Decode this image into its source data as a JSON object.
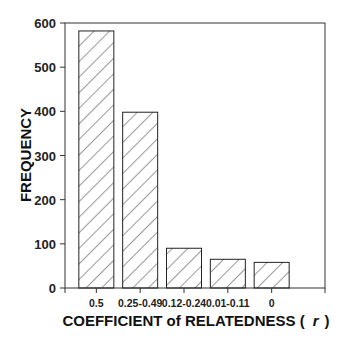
{
  "chart_data": {
    "type": "bar",
    "title": "",
    "xlabel": "COEFFICIENT of RELATEDNESS ( r )",
    "xlabel_main": "COEFFICIENT of RELATEDNESS (",
    "xlabel_symbol": "r",
    "xlabel_close": ")",
    "ylabel": "FREQUENCY",
    "categories": [
      "0.5",
      "0.25-0.49",
      "0.12-0.24",
      "0.01-0.11",
      "0"
    ],
    "values": [
      582,
      398,
      90,
      65,
      58
    ],
    "ylim": [
      0,
      600
    ],
    "yticks": [
      0,
      100,
      200,
      300,
      400,
      500,
      600
    ],
    "grid": false,
    "legend": null,
    "bar_fill": "diagonal-hatch",
    "bar_stroke": "#222222"
  }
}
